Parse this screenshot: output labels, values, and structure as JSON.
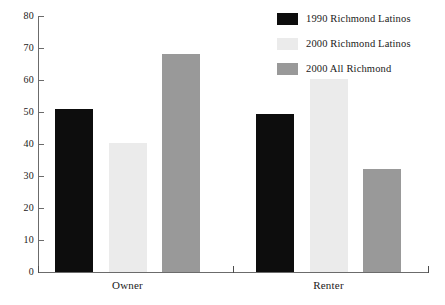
{
  "chart_data": {
    "type": "bar",
    "title": "",
    "subtitle": "",
    "xlabel": "",
    "ylabel": "",
    "categories": [
      "Owner",
      "Renter"
    ],
    "series": [
      {
        "name": "1990 Richmond Latinos",
        "color": "#0d0d0d",
        "values": [
          50.8,
          49.3
        ]
      },
      {
        "name": "2000 Richmond Latinos",
        "color": "#ebebeb",
        "values": [
          40.2,
          60.3
        ]
      },
      {
        "name": "2000 All Richmond",
        "color": "#999999",
        "values": [
          68.2,
          32.3
        ]
      }
    ],
    "ylim": [
      0,
      80
    ],
    "ytick_step": 10,
    "yticks": [
      0,
      10,
      20,
      30,
      40,
      50,
      60,
      70,
      80
    ],
    "ytick_labels": [
      "0",
      "10",
      "20",
      "30",
      "40",
      "50",
      "60",
      "70",
      "80"
    ],
    "grid": false,
    "legend_position": "top-right",
    "annotations": []
  },
  "legend": {
    "entries": [
      {
        "label": "1990 Richmond Latinos",
        "color": "#0d0d0d"
      },
      {
        "label": "2000 Richmond Latinos",
        "color": "#ebebeb"
      },
      {
        "label": "2000 All Richmond",
        "color": "#999999"
      }
    ]
  },
  "axes": {
    "y_tick_labels": [
      "80",
      "70",
      "60",
      "50",
      "40",
      "30",
      "20",
      "10",
      "0"
    ],
    "x_group_labels": [
      "Owner",
      "Renter"
    ]
  }
}
